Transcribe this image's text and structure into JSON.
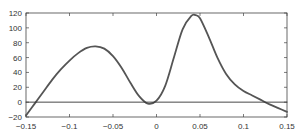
{
  "chart_data": {
    "type": "line",
    "title": "",
    "xlabel": "",
    "ylabel": "",
    "xlim": [
      -0.15,
      0.15
    ],
    "ylim": [
      -20,
      120
    ],
    "grid": false,
    "legend": null,
    "x_ticks": [
      -0.15,
      -0.1,
      -0.05,
      0,
      0.05,
      0.1,
      0.15
    ],
    "x_tick_labels": [
      "−0.15",
      "−0.1",
      "−0.05",
      "0",
      "0.05",
      "0.1",
      "0.15"
    ],
    "y_ticks": [
      -20,
      0,
      20,
      40,
      60,
      80,
      100,
      120
    ],
    "y_tick_labels": [
      "−20",
      "0",
      "20",
      "40",
      "60",
      "80",
      "100",
      "120"
    ],
    "series": [
      {
        "name": "curve",
        "color": "#555555",
        "x": [
          -0.15,
          -0.14,
          -0.13,
          -0.12,
          -0.11,
          -0.1,
          -0.09,
          -0.08,
          -0.07,
          -0.06,
          -0.05,
          -0.04,
          -0.03,
          -0.02,
          -0.01,
          0.0,
          0.01,
          0.02,
          0.03,
          0.04,
          0.045,
          0.05,
          0.06,
          0.07,
          0.08,
          0.09,
          0.1,
          0.11,
          0.12,
          0.13,
          0.14,
          0.15
        ],
        "y": [
          -18,
          -2,
          14,
          30,
          44,
          56,
          66,
          73,
          75,
          72,
          62,
          46,
          26,
          8,
          -2,
          2,
          22,
          60,
          98,
          116,
          117,
          113,
          88,
          60,
          38,
          24,
          15,
          9,
          3,
          -3,
          -8,
          -13
        ]
      },
      {
        "name": "zero-line",
        "color": "#333333",
        "x": [
          -0.15,
          0.15
        ],
        "y": [
          0,
          0
        ]
      }
    ]
  }
}
